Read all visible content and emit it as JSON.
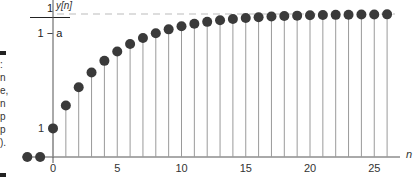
{
  "chart_data": {
    "type": "stem",
    "title": "",
    "xlabel": "n",
    "ylabel": "y[n]",
    "asymptote_label": {
      "numerator": "1",
      "denominator": "1 − a"
    },
    "y_tick_labels": [
      "1"
    ],
    "x_tick_labels": [
      "0",
      "5",
      "10",
      "15",
      "20",
      "25"
    ],
    "x_ticks": [
      0,
      5,
      10,
      15,
      20,
      25
    ],
    "xlim": [
      -2,
      27
    ],
    "ylim": [
      0,
      5.1
    ],
    "a": 0.8,
    "asymptote": 5,
    "grid": false,
    "legend": null,
    "x": [
      -2,
      -1,
      0,
      1,
      2,
      3,
      4,
      5,
      6,
      7,
      8,
      9,
      10,
      11,
      12,
      13,
      14,
      15,
      16,
      17,
      18,
      19,
      20,
      21,
      22,
      23,
      24,
      25,
      26
    ],
    "values": [
      0,
      0,
      1.0,
      1.8,
      2.44,
      2.952,
      3.362,
      3.689,
      3.951,
      4.161,
      4.329,
      4.463,
      4.571,
      4.656,
      4.725,
      4.78,
      4.824,
      4.859,
      4.887,
      4.91,
      4.928,
      4.942,
      4.954,
      4.963,
      4.97,
      4.976,
      4.981,
      4.985,
      4.988
    ]
  },
  "side_caption_fragments": [
    ":",
    "n",
    "e,",
    "n",
    "p",
    "p",
    ")."
  ],
  "colors": {
    "dot": "#3a3a3a",
    "stem": "#9a9a9a",
    "axis": "#555555",
    "asymptote": "#bbbbbb"
  }
}
